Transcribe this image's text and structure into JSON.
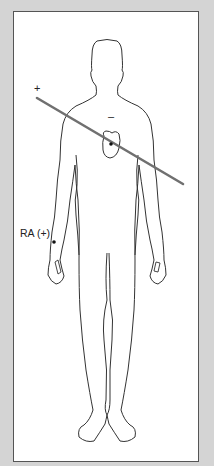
{
  "figure": {
    "labels": {
      "positive": "+",
      "negative": "–",
      "electrode": "RA (+)"
    },
    "colors": {
      "background": "#d4d4d4",
      "frame_bg": "#ffffff",
      "outline": "#333333",
      "axis_line": "#707070"
    },
    "axis_line": {
      "x1": 37,
      "y1": 98,
      "x2": 183,
      "y2": 184
    },
    "heart_dot": {
      "x": 111,
      "y": 144
    },
    "electrode_dot": {
      "x": 54,
      "y": 242
    }
  }
}
